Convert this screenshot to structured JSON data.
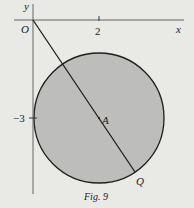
{
  "figure": {
    "caption": "Fig. 9",
    "axes": {
      "x_label": "x",
      "y_label": "y",
      "origin_label": "O",
      "x_tick_label": "2",
      "y_tick_label": "−3"
    },
    "points": {
      "center_label": "A",
      "endpoint_label": "Q"
    },
    "colors": {
      "background": "#e9e9e6",
      "circle_fill": "#bdbdbb",
      "stroke": "#1e1e1e"
    }
  }
}
